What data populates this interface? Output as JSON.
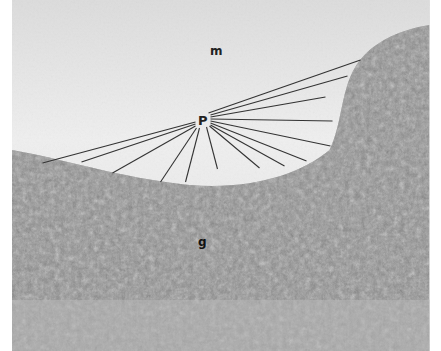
{
  "figure": {
    "type": "light micrograph (grayscale)",
    "labels": [
      {
        "id": "m",
        "text": "m",
        "x": 210,
        "y": 45
      },
      {
        "id": "P",
        "text": "P",
        "x": 198,
        "y": 114
      },
      {
        "id": "g",
        "text": "g",
        "x": 198,
        "y": 236
      }
    ],
    "pointer_lines": [
      {
        "x1": 196,
        "y1": 122,
        "x2": 43,
        "y2": 163
      },
      {
        "x1": 196,
        "y1": 124,
        "x2": 82,
        "y2": 162
      },
      {
        "x1": 196,
        "y1": 126,
        "x2": 113,
        "y2": 173
      },
      {
        "x1": 197,
        "y1": 128,
        "x2": 161,
        "y2": 182
      },
      {
        "x1": 200,
        "y1": 128,
        "x2": 186,
        "y2": 182
      },
      {
        "x1": 207,
        "y1": 127,
        "x2": 218,
        "y2": 169
      },
      {
        "x1": 210,
        "y1": 126,
        "x2": 260,
        "y2": 168
      },
      {
        "x1": 211,
        "y1": 125,
        "x2": 285,
        "y2": 166
      },
      {
        "x1": 211,
        "y1": 123,
        "x2": 307,
        "y2": 161
      },
      {
        "x1": 211,
        "y1": 121,
        "x2": 331,
        "y2": 146
      },
      {
        "x1": 211,
        "y1": 119,
        "x2": 333,
        "y2": 121
      },
      {
        "x1": 211,
        "y1": 117,
        "x2": 326,
        "y2": 97
      },
      {
        "x1": 211,
        "y1": 115,
        "x2": 348,
        "y2": 76
      },
      {
        "x1": 209,
        "y1": 113,
        "x2": 361,
        "y2": 60
      }
    ],
    "colors": {
      "molecular_layer": "#e6e6e6",
      "granular_layer": "#7a7a7a",
      "line": "#333333"
    }
  }
}
